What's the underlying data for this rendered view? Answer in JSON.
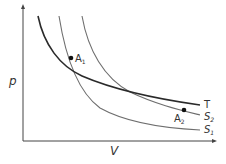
{
  "diagram": {
    "axes": {
      "y_label": "p",
      "x_label": "V"
    },
    "curves": [
      {
        "id": "T",
        "label": "T",
        "kind": "isotherm",
        "color": "#2a2a2a"
      },
      {
        "id": "S2",
        "label": "S",
        "subscript": "2",
        "kind": "adiabat",
        "color": "#6e6e6e"
      },
      {
        "id": "S1",
        "label": "S",
        "subscript": "1",
        "kind": "adiabat",
        "color": "#6e6e6e"
      }
    ],
    "points": [
      {
        "id": "A1",
        "label": "A",
        "subscript": "1"
      },
      {
        "id": "A2",
        "label": "A",
        "subscript": "2"
      }
    ]
  }
}
